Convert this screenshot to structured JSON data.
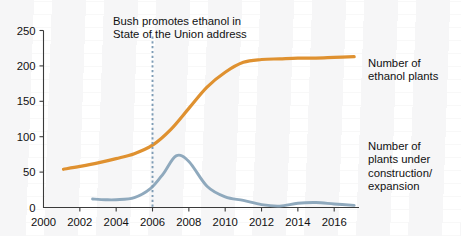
{
  "figure": {
    "background": "#ffffff",
    "ink": "#111111"
  },
  "annotation": {
    "name": "bush-ethanol-annotation",
    "text": "Bush promotes ethanol in\nState of the Union address",
    "marker_year": 2006,
    "marker_color": "#7e9cb5",
    "marker_style": "dashed-vertical"
  },
  "legend": {
    "orange_label": "Number of\nethanol plants",
    "blue_label": "Number of\nplants under\nconstruction/\nexpansion"
  },
  "chart_data": {
    "type": "line",
    "title": "",
    "subtitle": "",
    "xlabel": "",
    "ylabel": "",
    "xlim": [
      2000,
      2017.2
    ],
    "ylim": [
      0,
      250
    ],
    "grid": false,
    "legend_position": "right-inline",
    "yticks": [
      0,
      50,
      100,
      150,
      200,
      250
    ],
    "ytick_labels": [
      "0",
      "50",
      "100",
      "150",
      "200",
      "250"
    ],
    "xticks": [
      2000,
      2002,
      2004,
      2006,
      2008,
      2010,
      2012,
      2014,
      2016
    ],
    "xtick_labels": [
      "2000",
      "2002",
      "2004",
      "2006",
      "2008",
      "2010",
      "2012",
      "2014",
      "2016"
    ],
    "series": [
      {
        "name": "Number of ethanol plants",
        "color": "#df9130",
        "x": [
          2001.1,
          2002,
          2003,
          2004,
          2005,
          2006,
          2007,
          2008,
          2009,
          2010,
          2011,
          2012,
          2013,
          2014,
          2015,
          2016,
          2017.1
        ],
        "values": [
          54,
          58,
          63,
          69,
          76,
          88,
          110,
          140,
          170,
          191,
          205,
          209,
          210,
          211,
          211,
          212,
          213
        ]
      },
      {
        "name": "Number of plants under construction/expansion",
        "color": "#8fa9bd",
        "x": [
          2002.7,
          2003.4,
          2004,
          2005,
          2005.9,
          2006.6,
          2007.3,
          2008,
          2009,
          2010,
          2011,
          2012,
          2013,
          2014,
          2015,
          2016,
          2017.1
        ],
        "values": [
          12,
          11,
          11,
          14,
          27,
          48,
          73,
          65,
          30,
          15,
          10,
          4,
          2,
          6,
          7,
          5,
          3
        ]
      }
    ],
    "annotations": [
      {
        "text": "Bush promotes ethanol in State of the Union address",
        "x": 2006,
        "type": "vertical-dashed-line"
      }
    ]
  }
}
